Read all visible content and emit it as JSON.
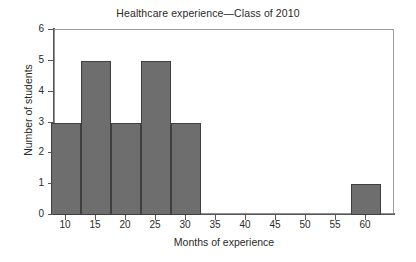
{
  "chart_data": {
    "type": "bar",
    "title": "Healthcare experience—Class of 2010",
    "xlabel": "Months of experience",
    "ylabel": "Number of students",
    "xlim": [
      7.5,
      64.2
    ],
    "ylim": [
      0,
      6
    ],
    "grid": false,
    "legend": null,
    "bin_width": 5,
    "categories": [
      "7.5–12.5",
      "12.5–17.5",
      "17.5–22.5",
      "22.5–27.5",
      "27.5–32.5",
      "57.5–62.5"
    ],
    "bins": [
      {
        "start": 7.5,
        "end": 12.5,
        "count": 3
      },
      {
        "start": 12.5,
        "end": 17.5,
        "count": 5
      },
      {
        "start": 17.5,
        "end": 22.5,
        "count": 3
      },
      {
        "start": 22.5,
        "end": 27.5,
        "count": 5
      },
      {
        "start": 27.5,
        "end": 32.5,
        "count": 3
      },
      {
        "start": 57.5,
        "end": 62.5,
        "count": 1
      }
    ],
    "values": [
      3,
      5,
      3,
      5,
      3,
      1
    ],
    "x_ticks": [
      10,
      15,
      20,
      25,
      30,
      35,
      40,
      45,
      50,
      55,
      60
    ],
    "x_tick_labels": [
      "10",
      "15",
      "20",
      "25",
      "30",
      "35",
      "40",
      "45",
      "50",
      "55",
      "60"
    ],
    "y_ticks": [
      0,
      1,
      2,
      3,
      4,
      5,
      6
    ],
    "y_tick_labels": [
      "0",
      "1",
      "2",
      "3",
      "4",
      "5",
      "6"
    ],
    "colors": {
      "bar_fill": "#6e6e6e",
      "bar_border": "#3f3f3f",
      "axis": "#595959",
      "frame": "#9a9a9a",
      "text": "#2a2a2a",
      "background": "#ffffff"
    }
  }
}
